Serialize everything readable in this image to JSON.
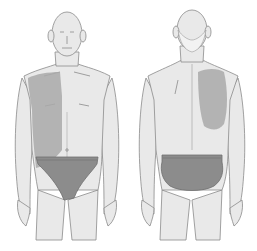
{
  "figure": {
    "views": [
      {
        "id": "front",
        "label": "Front view",
        "pain_region": "right shoulder and right upper chest/flank (anterior)"
      },
      {
        "id": "back",
        "label": "Back view",
        "pain_region": "right scapular region (posterior)"
      }
    ],
    "colors": {
      "background": "#ffffff",
      "skin": "#e9e9e9",
      "outline": "#8a8a8a",
      "pain_shading": "#a9a9a9",
      "underwear": "#8c8c8c",
      "hair": "#f2f2f2"
    }
  }
}
